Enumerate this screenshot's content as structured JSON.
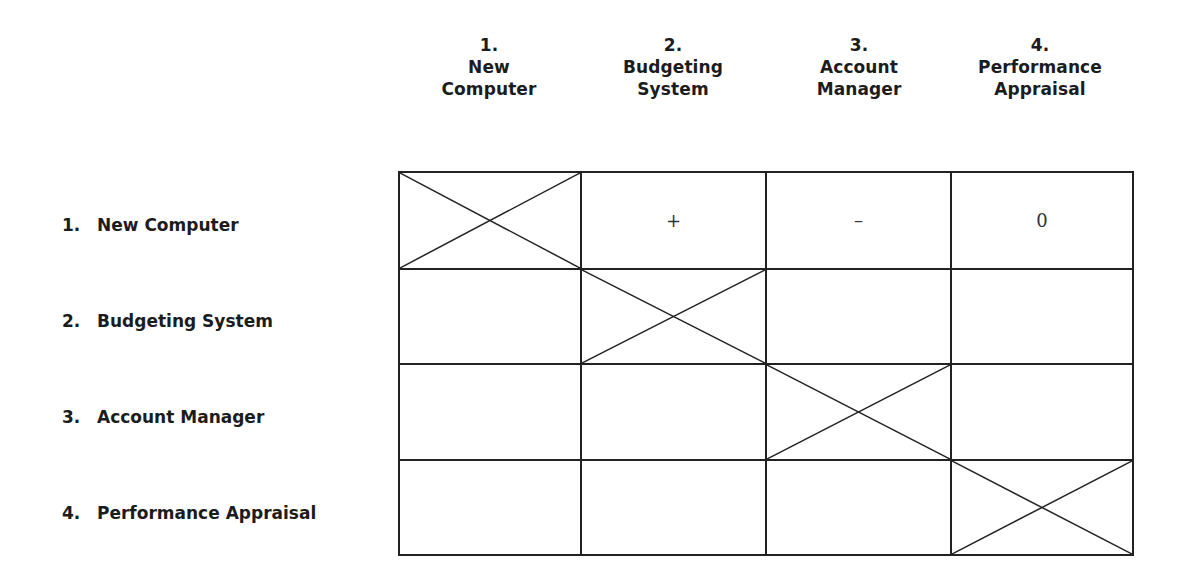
{
  "columns": [
    {
      "number": "1.",
      "line1": "New",
      "line2": "Computer"
    },
    {
      "number": "2.",
      "line1": "Budgeting",
      "line2": "System"
    },
    {
      "number": "3.",
      "line1": "Account",
      "line2": "Manager"
    },
    {
      "number": "4.",
      "line1": "Performance",
      "line2": "Appraisal"
    }
  ],
  "rows": [
    {
      "number": "1.",
      "label": "New Computer"
    },
    {
      "number": "2.",
      "label": "Budgeting System"
    },
    {
      "number": "3.",
      "label": "Account Manager"
    },
    {
      "number": "4.",
      "label": "Performance Appraisal"
    }
  ],
  "matrix": [
    [
      "X",
      "+",
      "–",
      "0"
    ],
    [
      "",
      "X",
      "",
      ""
    ],
    [
      "",
      "",
      "X",
      ""
    ],
    [
      "",
      "",
      "",
      "X"
    ]
  ],
  "cells": {
    "r0c1": "+",
    "r0c2": "–",
    "r0c3": "0"
  },
  "legend_note": "Diagonal cells marked with X (self-comparison)"
}
